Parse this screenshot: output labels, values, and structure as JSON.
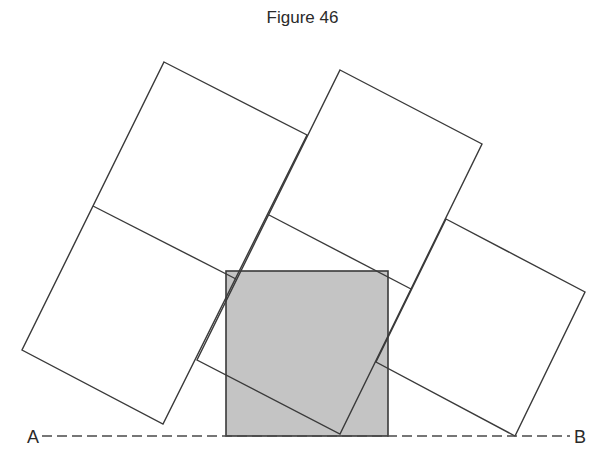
{
  "figure": {
    "title": "Figure 46",
    "point_a_label": "A",
    "point_b_label": "B",
    "colors": {
      "stroke": "#3a3a3a",
      "shaded_square_fill": "#c4c4c4",
      "background": "#ffffff"
    },
    "shapes": {
      "shaded_square": {
        "x": 226,
        "y": 271,
        "width": 162,
        "height": 165
      },
      "baseline": {
        "x1": 42,
        "y1": 436,
        "x2": 570,
        "y2": 436,
        "style": "dashed"
      },
      "tilted_rectangles": [
        {
          "name": "left-column",
          "points": "164,62 307,135 163,424 22,350",
          "divider": "93,206 236,279"
        },
        {
          "name": "middle-column",
          "points": "340,70 482,144 340,434 197,360",
          "divider": "269,215 411,289"
        },
        {
          "name": "right-square",
          "points": "446,219 585,292 515,436 376,362",
          "divider": ""
        }
      ]
    }
  }
}
